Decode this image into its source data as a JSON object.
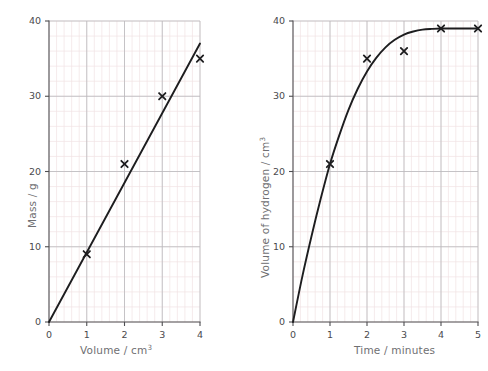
{
  "figure": {
    "background_color": "#ffffff",
    "grid_minor_color": "#f0e2e4",
    "grid_major_color": "#b9b9bc",
    "axis_color": "#4e4e51",
    "curve_color": "#1d1d1f",
    "marker_color": "#1d1d1f",
    "tick_label_color": "#4a4a4d",
    "axis_title_color": "#6f6f72"
  },
  "chart_data": [
    {
      "id": "mass-vs-volume",
      "type": "scatter",
      "title": "",
      "xlabel": "Volume / cm",
      "xlabel_sup": "3",
      "ylabel": "Mass / g",
      "ylabel_sup": "",
      "xlim": [
        0,
        4
      ],
      "ylim": [
        0,
        40
      ],
      "xticks": [
        0,
        1,
        2,
        3,
        4
      ],
      "xtick_labels": [
        "0",
        "1",
        "2",
        "3",
        "4"
      ],
      "yticks": [
        0,
        10,
        20,
        30,
        40
      ],
      "ytick_labels": [
        "0",
        "10",
        "20",
        "30",
        "40"
      ],
      "grid": "minor-and-major",
      "grid_minor_step_x": 0.2,
      "grid_minor_step_y": 2,
      "legend": "none",
      "marker": "x",
      "x": [
        1,
        2,
        3,
        4
      ],
      "values": [
        9,
        21,
        30,
        35
      ],
      "series": [
        {
          "name": "measured points",
          "marker": "x",
          "x": [
            1,
            2,
            3,
            4
          ],
          "values": [
            9,
            21,
            30,
            35
          ]
        },
        {
          "name": "best-fit line",
          "type": "line",
          "x": [
            0,
            4
          ],
          "values": [
            0,
            37
          ]
        }
      ]
    },
    {
      "id": "hydrogen-volume-vs-time",
      "type": "scatter",
      "title": "",
      "xlabel": "Time / minutes",
      "xlabel_sup": "",
      "ylabel": "Volume of hydrogen / cm",
      "ylabel_sup": "3",
      "xlim": [
        0,
        5
      ],
      "ylim": [
        0,
        40
      ],
      "xticks": [
        0,
        1,
        2,
        3,
        4,
        5
      ],
      "xtick_labels": [
        "0",
        "1",
        "2",
        "3",
        "4",
        "5"
      ],
      "yticks": [
        0,
        10,
        20,
        30,
        40
      ],
      "ytick_labels": [
        "0",
        "10",
        "20",
        "30",
        "40"
      ],
      "grid": "minor-and-major",
      "grid_minor_step_x": 0.2,
      "grid_minor_step_y": 2,
      "legend": "none",
      "marker": "x",
      "x": [
        1,
        2,
        3,
        4,
        5
      ],
      "values": [
        21,
        35,
        36,
        39,
        39
      ],
      "series": [
        {
          "name": "measured points",
          "marker": "x",
          "x": [
            1,
            2,
            3,
            4,
            5
          ],
          "values": [
            21,
            35,
            36,
            39,
            39
          ]
        },
        {
          "name": "best-fit curve",
          "type": "line",
          "x": [
            0,
            0.25,
            0.5,
            0.75,
            1,
            1.25,
            1.5,
            1.75,
            2,
            2.25,
            2.5,
            2.75,
            3,
            3.25,
            3.5,
            3.75,
            4,
            4.5,
            5
          ],
          "values": [
            0,
            6.0,
            11.4,
            16.4,
            21.0,
            24.8,
            28.2,
            31.0,
            33.3,
            35.1,
            36.5,
            37.5,
            38.2,
            38.6,
            38.85,
            38.95,
            39,
            39,
            39
          ]
        }
      ]
    }
  ]
}
